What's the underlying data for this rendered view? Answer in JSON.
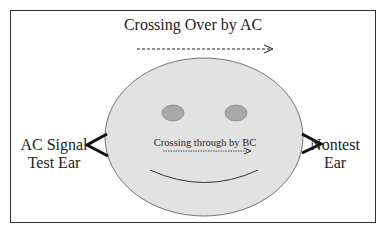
{
  "diagram": {
    "title": "Crossing Over by AC",
    "left_label": [
      "AC Signal",
      "Test Ear"
    ],
    "right_label": [
      "Nontest",
      "Ear"
    ],
    "inner_label": "Crossing through by BC",
    "colors": {
      "face": "#e2e2e2",
      "eyes": "#a9a9a9",
      "lines": "#222222",
      "border": "#333333"
    }
  }
}
